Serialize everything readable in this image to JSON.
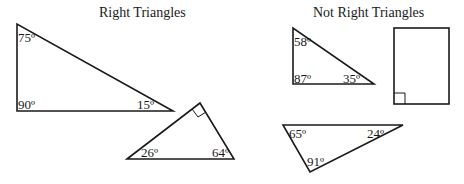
{
  "sections": {
    "right": {
      "title": "Right Triangles"
    },
    "not_right": {
      "title": "Not Right Triangles"
    }
  },
  "shapes": [
    {
      "id": "triangle-1",
      "group": "right",
      "angles": [
        "75º",
        "90º",
        "15º"
      ]
    },
    {
      "id": "triangle-2",
      "group": "right",
      "angles": [
        "26º",
        "64º"
      ],
      "right_angle_marker": true
    },
    {
      "id": "triangle-3",
      "group": "not_right",
      "angles": [
        "58º",
        "87º",
        "35º"
      ]
    },
    {
      "id": "rectangle",
      "group": "not_right",
      "right_angle_marker": true
    },
    {
      "id": "triangle-4",
      "group": "not_right",
      "angles": [
        "65º",
        "24º",
        "91º"
      ]
    }
  ],
  "colors": {
    "stroke": "#1a1a1a",
    "background": "#ffffff"
  }
}
